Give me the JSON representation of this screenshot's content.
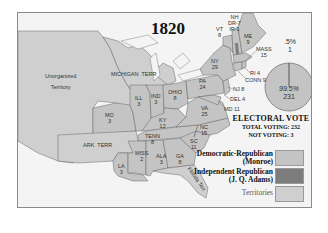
{
  "title": "1820",
  "colors": {
    "democratic_republican": "#c4c4c4",
    "independent_republican": "#7d7d7d",
    "territories": "#cfcfcf",
    "background": "#f4f4f4",
    "border": "#666666"
  },
  "regions": [
    {
      "id": "unorganized",
      "label": "Unorganized\nTerritory",
      "type": "territory"
    },
    {
      "id": "michigan-terr",
      "label": "MICHIGAN  TERR",
      "type": "territory"
    },
    {
      "id": "ark-terr",
      "label": "ARK  TERR",
      "type": "territory"
    },
    {
      "id": "florida-terr",
      "label": "Florida Terr",
      "type": "territory"
    },
    {
      "id": "nh",
      "label": "NH\nDR-7\nIR-1",
      "type": "split"
    },
    {
      "id": "vt",
      "label": "VT\n8",
      "type": "state"
    },
    {
      "id": "me",
      "label": "ME\n9",
      "type": "state"
    },
    {
      "id": "mass",
      "label": "MASS\n15",
      "type": "state"
    },
    {
      "id": "ny",
      "label": "NY\n29",
      "type": "state"
    },
    {
      "id": "ri",
      "label": "RI 4",
      "type": "state"
    },
    {
      "id": "conn",
      "label": "CONN 9",
      "type": "state"
    },
    {
      "id": "nj",
      "label": "NJ 8",
      "type": "state"
    },
    {
      "id": "del",
      "label": "DEL 4",
      "type": "state"
    },
    {
      "id": "md",
      "label": "MD 11",
      "type": "state"
    },
    {
      "id": "pa",
      "label": "PA\n24",
      "type": "state"
    },
    {
      "id": "ohio",
      "label": "OHIO\n8",
      "type": "state"
    },
    {
      "id": "ind",
      "label": "IND\n3",
      "type": "state"
    },
    {
      "id": "ill",
      "label": "ILL\n3",
      "type": "state"
    },
    {
      "id": "mo",
      "label": "MO\n3",
      "type": "state"
    },
    {
      "id": "ky",
      "label": "KY\n12",
      "type": "state"
    },
    {
      "id": "va",
      "label": "VA\n25",
      "type": "state"
    },
    {
      "id": "tenn",
      "label": "TENN\n8",
      "type": "state"
    },
    {
      "id": "nc",
      "label": "NC\n15",
      "type": "state"
    },
    {
      "id": "sc",
      "label": "SC\n11",
      "type": "state"
    },
    {
      "id": "ga",
      "label": "GA\n8",
      "type": "state"
    },
    {
      "id": "ala",
      "label": "ALA\n3",
      "type": "state"
    },
    {
      "id": "miss",
      "label": "MISS\n2",
      "type": "state"
    },
    {
      "id": "la",
      "label": "LA\n3",
      "type": "state"
    }
  ],
  "pie": {
    "minor_pct": ".5%",
    "minor_votes": "1",
    "major_pct": "99.5%",
    "major_votes": "231"
  },
  "electoral": {
    "heading": "ELECTORAL VOTE",
    "total": "TOTAL VOTING: 232",
    "not_voting": "NOT VOTING: 3"
  },
  "legend": [
    {
      "label1": "Democratic-Republican",
      "label2": "(Monroe)",
      "color": "#c4c4c4"
    },
    {
      "label1": "Independent Republican",
      "label2": "(J. Q. Adams)",
      "color": "#7d7d7d"
    },
    {
      "label1": "Territories",
      "label2": "",
      "color": "#cfcfcf"
    }
  ]
}
